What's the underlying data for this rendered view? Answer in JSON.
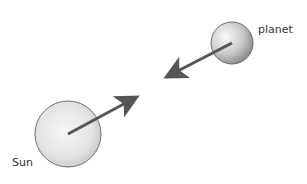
{
  "diagram": {
    "bodies": [
      {
        "id": "planet",
        "label": "planet",
        "cx": 232,
        "cy": 43,
        "r": 21
      },
      {
        "id": "sun",
        "label": "Sun",
        "cx": 68,
        "cy": 134,
        "r": 33
      }
    ],
    "arrows": [
      {
        "id": "force-on-planet",
        "from": "planet",
        "x1": 232,
        "y1": 43,
        "x2": 166,
        "y2": 77
      },
      {
        "id": "force-on-sun",
        "from": "sun",
        "x1": 68,
        "y1": 134,
        "x2": 137,
        "y2": 97
      }
    ],
    "colors": {
      "arrow": "#555555",
      "sphere_light": "#f4f4f4",
      "sphere_dark": "#9a9a9a",
      "sphere_outline": "#6d6d6d",
      "text": "#333333"
    }
  },
  "labels": {
    "planet": "planet",
    "sun": "Sun"
  }
}
